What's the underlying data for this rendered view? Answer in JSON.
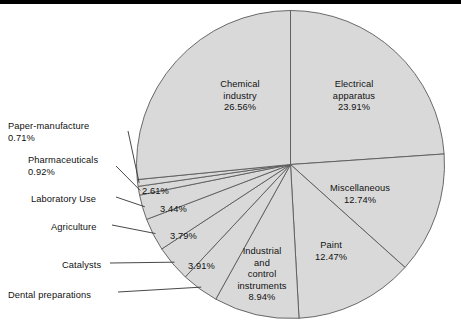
{
  "figure": {
    "background_color": "#ffffff",
    "slice_fill_color": "#d9d9d9",
    "slice_edge_color": "#5a5a5a",
    "text_color": "#111111",
    "top_rule_color": "#000000"
  },
  "chart_data": {
    "type": "pie",
    "title": "",
    "subtitle": "",
    "xlabel": "",
    "ylabel": "",
    "legend": "none",
    "grid": false,
    "units": "percent",
    "total": 100.0,
    "start_angle_deg": 0,
    "direction": "clockwise",
    "categories": [
      "Electrical apparatus",
      "Miscellaneous",
      "Paint",
      "Industrial and control instruments",
      "Dental preparations",
      "Catalysts",
      "Agriculture",
      "Laboratory Use",
      "Pharmaceuticals",
      "Paper-manufacture",
      "Chemical industry"
    ],
    "values": [
      23.91,
      12.74,
      12.47,
      8.94,
      3.91,
      3.79,
      3.44,
      2.61,
      0.92,
      0.71,
      26.56
    ],
    "slices": [
      {
        "label": "Electrical apparatus",
        "value": 23.91,
        "value_text": "23.91%",
        "label_placement": "inside"
      },
      {
        "label": "Miscellaneous",
        "value": 12.74,
        "value_text": "12.74%",
        "label_placement": "inside"
      },
      {
        "label": "Paint",
        "value": 12.47,
        "value_text": "12.47%",
        "label_placement": "inside"
      },
      {
        "label": "Industrial and control instruments",
        "value": 8.94,
        "value_text": "8.94%",
        "label_placement": "inside"
      },
      {
        "label": "Dental preparations",
        "value": 3.91,
        "value_text": "3.91%",
        "label_placement": "leader"
      },
      {
        "label": "Catalysts",
        "value": 3.79,
        "value_text": "3.79%",
        "label_placement": "leader"
      },
      {
        "label": "Agriculture",
        "value": 3.44,
        "value_text": "3.44%",
        "label_placement": "leader"
      },
      {
        "label": "Laboratory Use",
        "value": 2.61,
        "value_text": "2.61%",
        "label_placement": "leader"
      },
      {
        "label": "Pharmaceuticals",
        "value": 0.92,
        "value_text": "0.92%",
        "label_placement": "leader"
      },
      {
        "label": "Paper-manufacture",
        "value": 0.71,
        "value_text": "0.71%",
        "label_placement": "leader"
      },
      {
        "label": "Chemical industry",
        "value": 26.56,
        "value_text": "26.56%",
        "label_placement": "inside"
      }
    ]
  },
  "inside_labels": [
    {
      "name": "chemical-industry",
      "line1": "Chemical",
      "line2": "industry",
      "line3": "26.56%",
      "x": 240,
      "y": 79
    },
    {
      "name": "electrical-apparatus",
      "line1": "Electrical",
      "line2": "apparatus",
      "line3": "23.91%",
      "x": 354,
      "y": 79
    },
    {
      "name": "miscellaneous",
      "line1": "Miscellaneous",
      "line2": "12.74%",
      "line3": "",
      "x": 360,
      "y": 183
    },
    {
      "name": "paint",
      "line1": "Paint",
      "line2": "12.47%",
      "line3": "",
      "x": 331,
      "y": 240
    },
    {
      "name": "industrial-and-control-instruments",
      "line1": "Industrial",
      "line2": "and",
      "line3": "control",
      "line4": "instruments",
      "line5": "8.94%",
      "x": 262,
      "y": 246
    }
  ],
  "value_labels": [
    {
      "name": "laboratory-use-value",
      "text": "2.61%",
      "x": 142,
      "y": 186
    },
    {
      "name": "agriculture-value",
      "text": "3.44%",
      "x": 160,
      "y": 204
    },
    {
      "name": "catalysts-value",
      "text": "3.79%",
      "x": 170,
      "y": 231
    },
    {
      "name": "dental-preparations-value",
      "text": "3.91%",
      "x": 188,
      "y": 261
    }
  ],
  "leader_labels": [
    {
      "name": "paper-manufacture",
      "line1": "Paper-manufacture",
      "line2": "0.71%",
      "x": 8,
      "y": 121
    },
    {
      "name": "pharmaceuticals",
      "line1": "Pharmaceuticals",
      "line2": "0.92%",
      "x": 28,
      "y": 155
    },
    {
      "name": "laboratory-use",
      "line1": "Laboratory Use",
      "line2": "",
      "x": 31,
      "y": 194
    },
    {
      "name": "agriculture",
      "line1": "Agriculture",
      "line2": "",
      "x": 51,
      "y": 222
    },
    {
      "name": "catalysts",
      "line1": "Catalysts",
      "line2": "",
      "x": 62,
      "y": 260
    },
    {
      "name": "dental-preparations",
      "line1": "Dental preparations",
      "line2": "",
      "x": 8,
      "y": 290
    }
  ]
}
